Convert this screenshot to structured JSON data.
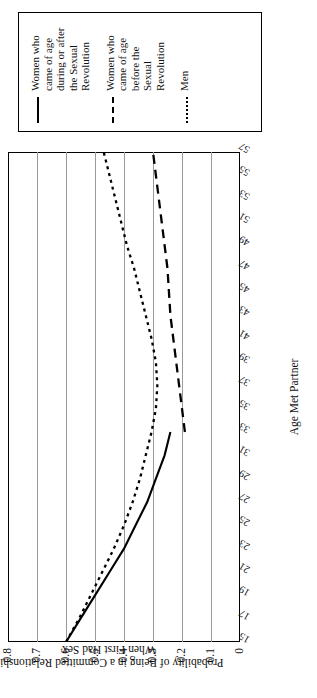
{
  "chart_data": {
    "type": "line",
    "title": "",
    "xlabel": "Age Met Partner",
    "ylabel": "Probability of Being in a Committed Relationship When First Had Sex",
    "xlim": [
      15,
      57
    ],
    "ylim": [
      0,
      0.8
    ],
    "ytick_labels": [
      "0.8",
      "0.7",
      "0.6",
      "0.5",
      "0.4",
      "0.3",
      "0.2",
      "0.1",
      "0"
    ],
    "ytick_values": [
      0.8,
      0.7,
      0.6,
      0.5,
      0.4,
      0.3,
      0.2,
      0.1,
      0
    ],
    "xtick_labels": [
      "15",
      "17",
      "19",
      "21",
      "23",
      "25",
      "27",
      "29",
      "31",
      "33",
      "35",
      "37",
      "39",
      "41",
      "43",
      "45",
      "47",
      "49",
      "51",
      "53",
      "55",
      "57"
    ],
    "x": [
      15,
      17,
      19,
      21,
      23,
      25,
      27,
      29,
      31,
      33,
      35,
      37,
      39,
      41,
      43,
      45,
      47,
      49,
      51,
      53,
      55,
      57
    ],
    "grid": "vertical-gridlines-at-y-ticks",
    "legend_position": "right",
    "series": [
      {
        "name": "Women who came of age during or after the Sexual Revolution",
        "style": "solid",
        "color": "#000000",
        "x": [
          15,
          17,
          19,
          21,
          23,
          25,
          27,
          29,
          31,
          33
        ],
        "values": [
          0.6,
          0.55,
          0.5,
          0.45,
          0.4,
          0.36,
          0.32,
          0.29,
          0.26,
          0.24
        ]
      },
      {
        "name": "Women who came of age before the Sexual Revolution",
        "style": "dashed",
        "color": "#000000",
        "x": [
          33,
          35,
          37,
          39,
          41,
          43,
          45,
          47,
          49,
          51,
          53,
          55,
          57
        ],
        "values": [
          0.19,
          0.2,
          0.21,
          0.22,
          0.23,
          0.24,
          0.245,
          0.25,
          0.26,
          0.27,
          0.28,
          0.29,
          0.3
        ]
      },
      {
        "name": "Men",
        "style": "dotted",
        "color": "#000000",
        "x": [
          15,
          17,
          19,
          21,
          23,
          25,
          27,
          29,
          31,
          33,
          35,
          37,
          39,
          41,
          43,
          45,
          47,
          49,
          51,
          53,
          55,
          57
        ],
        "values": [
          0.6,
          0.555,
          0.515,
          0.475,
          0.435,
          0.4,
          0.37,
          0.345,
          0.325,
          0.305,
          0.29,
          0.285,
          0.29,
          0.305,
          0.325,
          0.345,
          0.365,
          0.39,
          0.41,
          0.43,
          0.45,
          0.47
        ]
      }
    ]
  },
  "legend": {
    "items": [
      {
        "label": "Women who came of age during or after the Sexual Revolution",
        "style": "solid"
      },
      {
        "label": "Women who came of age before the Sexual Revolution",
        "style": "dashed"
      },
      {
        "label": "Men",
        "style": "dotted"
      }
    ]
  }
}
